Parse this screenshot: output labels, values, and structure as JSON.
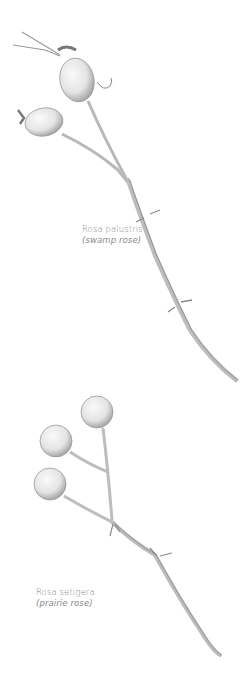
{
  "illustrations": [
    {
      "id": "swamp-rose",
      "latin_name": "Rosa palustris",
      "common_name": "(swamp rose)"
    },
    {
      "id": "prairie-rose",
      "latin_name": "Rosa setigera",
      "common_name": "(prairie rose)"
    }
  ],
  "colors": {
    "background": "#ffffff",
    "caption_text": "#8a8a8a",
    "stem": "#bdbdbd",
    "stem_shadow": "#8c8c8c",
    "hip_fill": "#ececec",
    "hip_shade": "#a8a8a8"
  }
}
